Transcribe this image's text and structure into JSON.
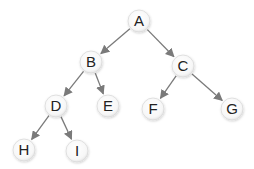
{
  "diagram": {
    "type": "binary-tree",
    "edge_color": "#7a7a7a",
    "node_fill": "#ffffff",
    "node_stroke": "#d9d9d9",
    "nodes": [
      {
        "id": "A",
        "label": "A",
        "x": 139,
        "y": 21
      },
      {
        "id": "B",
        "label": "B",
        "x": 91,
        "y": 62
      },
      {
        "id": "C",
        "label": "C",
        "x": 183,
        "y": 66
      },
      {
        "id": "D",
        "label": "D",
        "x": 56,
        "y": 106
      },
      {
        "id": "E",
        "label": "E",
        "x": 108,
        "y": 106
      },
      {
        "id": "F",
        "label": "F",
        "x": 153,
        "y": 109
      },
      {
        "id": "G",
        "label": "G",
        "x": 232,
        "y": 109
      },
      {
        "id": "H",
        "label": "H",
        "x": 24,
        "y": 150
      },
      {
        "id": "I",
        "label": "I",
        "x": 77,
        "y": 151
      }
    ],
    "edges": [
      {
        "from": "A",
        "to": "B"
      },
      {
        "from": "A",
        "to": "C"
      },
      {
        "from": "B",
        "to": "D"
      },
      {
        "from": "B",
        "to": "E"
      },
      {
        "from": "C",
        "to": "F"
      },
      {
        "from": "C",
        "to": "G"
      },
      {
        "from": "D",
        "to": "H"
      },
      {
        "from": "D",
        "to": "I"
      }
    ]
  }
}
